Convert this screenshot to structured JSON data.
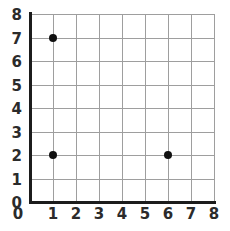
{
  "chart_data": {
    "type": "scatter",
    "title": "",
    "subtitle": "",
    "xlabel": "",
    "ylabel": "",
    "xlim": [
      0,
      8
    ],
    "ylim": [
      0,
      8
    ],
    "x_ticks": [
      0,
      1,
      2,
      3,
      4,
      5,
      6,
      7,
      8
    ],
    "y_ticks": [
      0,
      1,
      2,
      3,
      4,
      5,
      6,
      7,
      8
    ],
    "x_tick_labels": [
      "0",
      "1",
      "2",
      "3",
      "4",
      "5",
      "6",
      "7",
      "8"
    ],
    "y_tick_labels": [
      "0",
      "1",
      "2",
      "3",
      "4",
      "5",
      "6",
      "7",
      "8"
    ],
    "grid": true,
    "legend": "none",
    "points": [
      {
        "x": 1,
        "y": 7,
        "label": "(1, 7)"
      },
      {
        "x": 1,
        "y": 2,
        "label": "(1, 2)"
      },
      {
        "x": 6,
        "y": 2,
        "label": "(6, 2)"
      }
    ],
    "annotations": []
  },
  "style": {
    "point_color": "#111111",
    "grid_color": "#9e9e9e",
    "axis_color": "#1c1c1c",
    "label_color": "#2b2b2b",
    "background": "#ffffff"
  }
}
